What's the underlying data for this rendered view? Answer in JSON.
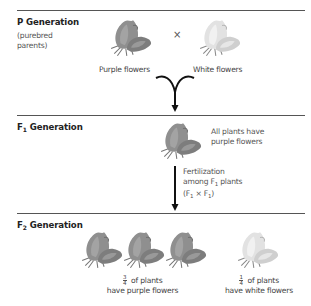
{
  "diagram": {
    "type": "mendel-monohybrid-cross",
    "colors": {
      "rule": "#555555",
      "arrow": "#111111",
      "purple_flower_fill": "#8f8f8f",
      "purple_flower_shade": "#6e6e6e",
      "white_flower_fill": "#e6e6e6",
      "white_flower_shade": "#c9c9c9",
      "stem": "#777777"
    },
    "p_generation": {
      "label_prefix": "P",
      "label_suffix": " Generation",
      "note_line1": "(purebred",
      "note_line2": "parents)",
      "cross_symbol": "×",
      "parent1_caption": "Purple flowers",
      "parent2_caption": "White flowers",
      "parent1_icon": "purple-flower-icon",
      "parent2_icon": "white-flower-icon"
    },
    "f1_generation": {
      "label_prefix": "F",
      "label_sub": "1",
      "label_suffix": " Generation",
      "result_line1": "All plants have",
      "result_line2": "purple flowers",
      "fert_line1": "Fertilization",
      "fert_line2_pre": "among F",
      "fert_line2_sub": "1",
      "fert_line2_post": " plants",
      "fert_line3_open": "(F",
      "fert_line3_sub1": "1",
      "fert_line3_mid": " × F",
      "fert_line3_sub2": "1",
      "fert_line3_close": ")",
      "plant_icon": "purple-flower-icon"
    },
    "f2_generation": {
      "label_prefix": "F",
      "label_sub": "2",
      "label_suffix": " Generation",
      "purple_count": 3,
      "white_count": 1,
      "purple_fraction_num": "3",
      "purple_fraction_den": "4",
      "purple_caption_line1": " of plants",
      "purple_caption_line2": "have purple flowers",
      "white_fraction_num": "1",
      "white_fraction_den": "4",
      "white_caption_line1": " of plants",
      "white_caption_line2": "have white flowers"
    }
  }
}
